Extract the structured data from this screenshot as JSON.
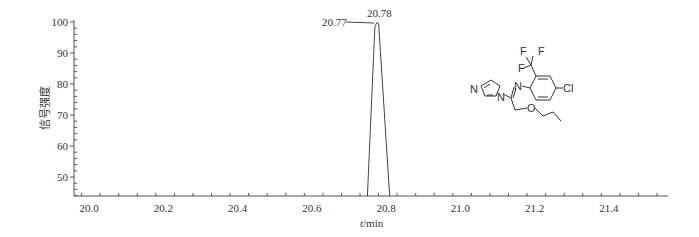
{
  "chart_data": {
    "type": "line",
    "title": "",
    "xlabel": "t/min",
    "ylabel": "信号强度",
    "xlim": [
      19.96,
      21.56
    ],
    "ylim": [
      44,
      100
    ],
    "x_ticks": [
      "20.0",
      "20.2",
      "20.4",
      "20.6",
      "20.8",
      "21.0",
      "21.2",
      "21.4"
    ],
    "y_ticks": [
      "50",
      "60",
      "70",
      "80",
      "90",
      "100"
    ],
    "grid": false,
    "series": [
      {
        "name": "chromatogram",
        "x": [
          20.75,
          20.77,
          20.775,
          20.78,
          20.81
        ],
        "y": [
          44,
          98.5,
          99.8,
          99.5,
          44
        ]
      }
    ],
    "annotations": [
      {
        "label": "20.77",
        "x": 20.77,
        "y": 99
      },
      {
        "label": "20.78",
        "x": 20.78,
        "y": 99.8
      }
    ],
    "inset": {
      "type": "chemical-structure",
      "atoms_labels": [
        "N",
        "N",
        "N",
        "O",
        "F",
        "F",
        "F",
        "Cl"
      ]
    }
  },
  "labels": {
    "peak_left": "20.77",
    "peak_right": "20.78",
    "ylabel": "信号强度",
    "xlabel_italic": "t",
    "xlabel_rest": "/min"
  },
  "molecule": {
    "N1": "N",
    "N2": "N",
    "N_imine": "N",
    "O": "O",
    "F1": "F",
    "F2": "F",
    "F3": "F",
    "Cl": "Cl"
  }
}
